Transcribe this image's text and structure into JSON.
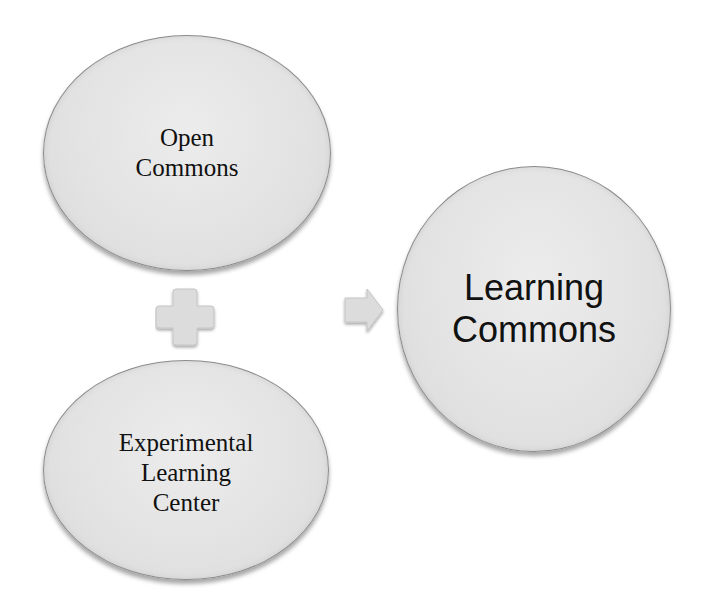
{
  "diagram": {
    "type": "equation-flow",
    "nodes": [
      {
        "id": "open-commons",
        "lines": [
          "Open",
          "Commons"
        ]
      },
      {
        "id": "experimental-learning-center",
        "lines": [
          "Experimental",
          "Learning",
          "Center"
        ]
      },
      {
        "id": "learning-commons",
        "lines": [
          "Learning",
          "Commons"
        ]
      }
    ],
    "operators": [
      {
        "icon": "plus-icon",
        "between": [
          "open-commons",
          "experimental-learning-center"
        ]
      },
      {
        "icon": "arrow-right-icon",
        "from": [
          "open-commons",
          "experimental-learning-center"
        ],
        "to": "learning-commons"
      }
    ],
    "colors": {
      "shape_fill": "#e4e4e4",
      "shape_border": "#8a8a8a",
      "operator_fill": "#d9d9d9",
      "text": "#111111",
      "background": "#ffffff"
    }
  }
}
